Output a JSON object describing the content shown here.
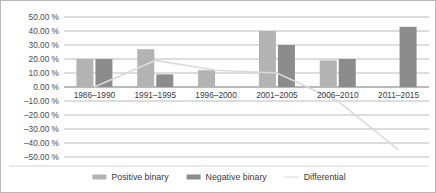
{
  "chart_data": {
    "type": "bar",
    "title": "",
    "xlabel": "",
    "ylabel": "",
    "categories": [
      "1986–1990",
      "1991–1995",
      "1996–2000",
      "2001–2005",
      "2006–2010",
      "2011–2015"
    ],
    "series": [
      {
        "name": "Positive binary",
        "type": "bar",
        "color": "#b3b3b3",
        "values": [
          20.0,
          27.0,
          12.0,
          40.0,
          19.0,
          0.0
        ]
      },
      {
        "name": "Negative binary",
        "type": "bar",
        "color": "#8c8c8c",
        "values": [
          20.0,
          9.0,
          0.0,
          30.0,
          20.0,
          43.0
        ]
      },
      {
        "name": "Differential",
        "type": "line",
        "color": "#d9d9d9",
        "values": [
          0.0,
          19.0,
          12.0,
          10.0,
          -10.0,
          -45.0
        ]
      }
    ],
    "ylim": [
      -50,
      50
    ],
    "ytick_step": 10,
    "ytick_labels": [
      "50.00 %",
      "40.00 %",
      "30.00 %",
      "20.00 %",
      "10.00 %",
      "0.00 %",
      "–10.00 %",
      "–20.00 %",
      "–30.00 %",
      "–40.00 %",
      "–50.00 %"
    ],
    "ytick_values": [
      50,
      40,
      30,
      20,
      10,
      0,
      -10,
      -20,
      -30,
      -40,
      -50
    ],
    "grid": true,
    "legend_position": "bottom",
    "legend": [
      {
        "label": "Positive binary",
        "marker": "bar",
        "color": "#b3b3b3"
      },
      {
        "label": "Negative binary",
        "marker": "bar",
        "color": "#8c8c8c"
      },
      {
        "label": "Differential",
        "marker": "line",
        "color": "#d9d9d9"
      }
    ]
  }
}
